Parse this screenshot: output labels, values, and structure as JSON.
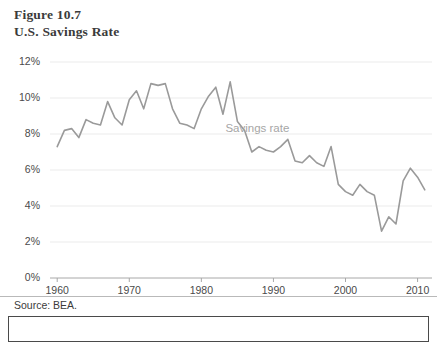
{
  "figure": {
    "label": "Figure 10.7",
    "title": "U.S. Savings Rate",
    "top_artifact": "",
    "source": "Source: BEA."
  },
  "colors": {
    "line": "#9a9a9a",
    "gridline": "#ebebeb",
    "axis": "#a8a8a8",
    "tick_text": "#4a4a4a",
    "title_text": "#3b3b3b",
    "annotation_text": "#a6a6a6"
  },
  "chart_data": {
    "type": "line",
    "title": "U.S. Savings Rate",
    "subtitle": "Figure 10.7",
    "xlabel": "",
    "ylabel": "",
    "xlim": [
      1959,
      2012
    ],
    "ylim": [
      0,
      12
    ],
    "ytick_labels": [
      "0%",
      "2%",
      "4%",
      "6%",
      "8%",
      "10%",
      "12%"
    ],
    "ytick_values": [
      0,
      2,
      4,
      6,
      8,
      10,
      12
    ],
    "xtick_labels": [
      "1960",
      "1970",
      "1980",
      "1990",
      "2000",
      "2010"
    ],
    "xtick_values": [
      1960,
      1970,
      1980,
      1990,
      2000,
      2010
    ],
    "grid": "horizontal",
    "legend": "inline-annotation",
    "annotations": [
      {
        "text": "Savings rate",
        "x": 1990,
        "y": 8.2
      }
    ],
    "series": [
      {
        "name": "Savings rate",
        "color": "#9a9a9a",
        "units": "percent of disposable income",
        "x": [
          1960,
          1961,
          1962,
          1963,
          1964,
          1965,
          1966,
          1967,
          1968,
          1969,
          1970,
          1971,
          1972,
          1973,
          1974,
          1975,
          1976,
          1977,
          1978,
          1979,
          1980,
          1981,
          1982,
          1983,
          1984,
          1985,
          1986,
          1987,
          1988,
          1989,
          1990,
          1991,
          1992,
          1993,
          1994,
          1995,
          1996,
          1997,
          1998,
          1999,
          2000,
          2001,
          2002,
          2003,
          2004,
          2005,
          2006,
          2007,
          2008,
          2009,
          2010,
          2011
        ],
        "values": [
          7.3,
          8.2,
          8.3,
          7.8,
          8.8,
          8.6,
          8.5,
          9.8,
          8.9,
          8.5,
          9.9,
          10.4,
          9.4,
          10.8,
          10.7,
          10.8,
          9.4,
          8.6,
          8.5,
          8.3,
          9.4,
          10.1,
          10.6,
          9.1,
          10.9,
          8.7,
          8.2,
          7.0,
          7.3,
          7.1,
          7.0,
          7.3,
          7.7,
          6.5,
          6.4,
          6.8,
          6.4,
          6.2,
          7.3,
          5.2,
          4.8,
          4.6,
          5.2,
          4.8,
          4.6,
          2.6,
          3.4,
          3.0,
          5.4,
          6.1,
          5.6,
          4.9
        ]
      }
    ]
  }
}
